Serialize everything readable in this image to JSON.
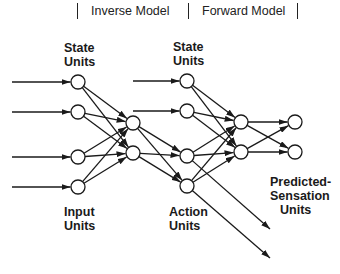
{
  "header": {
    "sections": [
      {
        "label": "Inverse Model"
      },
      {
        "label": "Forward Model"
      }
    ]
  },
  "labels": {
    "state_units_1": "State\nUnits",
    "state_units_2": "State\nUnits",
    "input_units": "Input\nUnits",
    "action_units": "Action\nUnits",
    "predicted_sensation_units": "Predicted-\nSensation\nUnits"
  },
  "labels_lines": {
    "state1": [
      "State",
      "Units"
    ],
    "state2": [
      "State",
      "Units"
    ],
    "input": [
      "Input",
      "Units"
    ],
    "action": [
      "Action",
      "Units"
    ],
    "predicted": [
      "Predicted-",
      "Sensation",
      "Units"
    ]
  },
  "network": {
    "layers": [
      {
        "name": "inverse-input-layer",
        "x": 78,
        "nodes_y": [
          82,
          112,
          157,
          187
        ],
        "roles": [
          "state",
          "state",
          "input",
          "input"
        ]
      },
      {
        "name": "inverse-hidden-layer",
        "x": 133,
        "nodes_y": [
          123,
          153
        ]
      },
      {
        "name": "forward-input-layer",
        "x": 187,
        "nodes_y": [
          81,
          111,
          156,
          186
        ],
        "roles": [
          "state",
          "state",
          "action",
          "action"
        ]
      },
      {
        "name": "forward-hidden-layer",
        "x": 241,
        "nodes_y": [
          122,
          152
        ]
      },
      {
        "name": "predicted-sensation-layer",
        "x": 295,
        "nodes_y": [
          122,
          152
        ]
      }
    ],
    "node_radius": 7,
    "colors": {
      "stroke": "#1a1a1a",
      "fill": "#ffffff"
    }
  }
}
